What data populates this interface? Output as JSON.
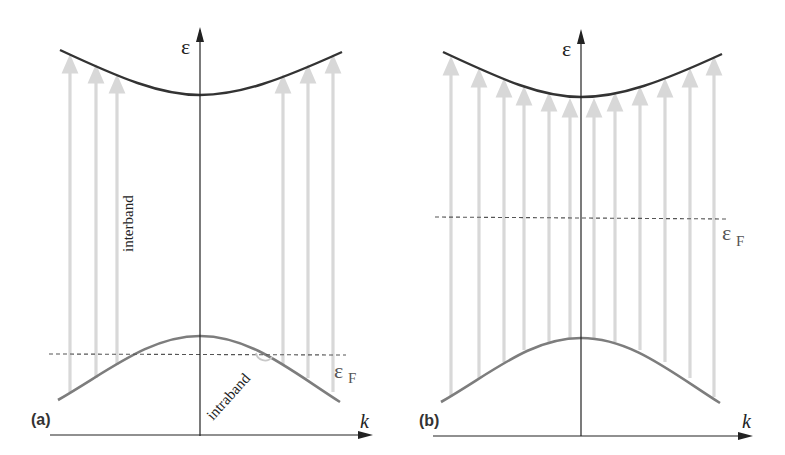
{
  "figure": {
    "panels": [
      {
        "id": "a",
        "label": "(a)",
        "y_axis_label": "ε",
        "x_axis_label": "k",
        "fermi_label": "ε",
        "fermi_sub": "F",
        "interband_label": "interband",
        "intraband_label": "intraband",
        "description": "Fermi level crosses the lower (valence) band; interband transitions only at large |k|, intraband transitions near Fermi crossing"
      },
      {
        "id": "b",
        "label": "(b)",
        "y_axis_label": "ε",
        "x_axis_label": "k",
        "fermi_label": "ε",
        "fermi_sub": "F",
        "description": "Fermi level lies in the gap; interband transitions at all k"
      }
    ],
    "colors": {
      "axis": "#222222",
      "conduction_band": "#333333",
      "valence_band": "#7a7a7a",
      "arrows": "#d6d6d6",
      "fermi_line": "#555555"
    }
  }
}
